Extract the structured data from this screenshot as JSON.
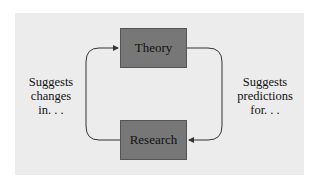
{
  "diagram": {
    "nodes": [
      {
        "id": "theory",
        "label": "Theory"
      },
      {
        "id": "research",
        "label": "Research"
      }
    ],
    "edges": [
      {
        "from": "theory",
        "to": "research",
        "label_lines": [
          "Suggests",
          "predictions",
          "for. . ."
        ]
      },
      {
        "from": "research",
        "to": "theory",
        "label_lines": [
          "Suggests",
          "changes",
          "in. . ."
        ]
      }
    ],
    "colors": {
      "panel": "#ececec",
      "box": "#777777",
      "line": "#333333"
    }
  }
}
